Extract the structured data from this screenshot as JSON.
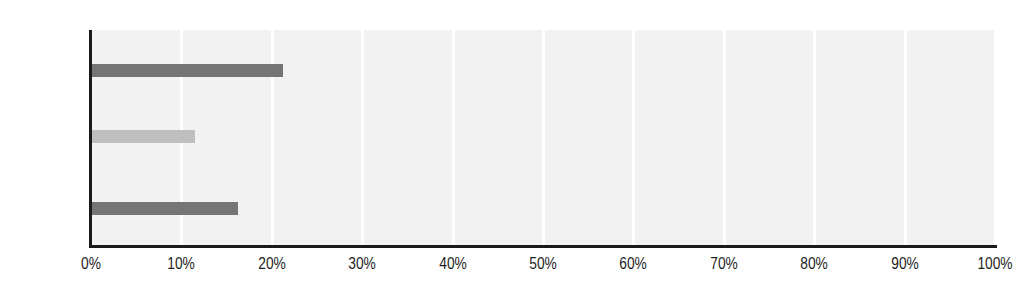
{
  "chart_data": {
    "type": "bar",
    "orientation": "horizontal",
    "title": "",
    "xlabel": "",
    "ylabel": "",
    "categories": [
      "Men",
      "Women",
      "All"
    ],
    "values": [
      21.2,
      11.5,
      16.3
    ],
    "bar_colors": [
      "#757575",
      "#bfbfbf",
      "#757575"
    ],
    "xlim": [
      0,
      100
    ],
    "xticks": [
      0,
      10,
      20,
      30,
      40,
      50,
      60,
      70,
      80,
      90,
      100
    ],
    "xtick_labels": [
      "0%",
      "10%",
      "20%",
      "30%",
      "40%",
      "50%",
      "60%",
      "70%",
      "80%",
      "90%",
      "100%"
    ],
    "grid": "vertical",
    "gridline_color": "#ffffff",
    "plot_background": "#f2f2f2",
    "axis_color": "#1a1a1a",
    "legend": "none",
    "series": [
      {
        "name": "Share",
        "points": [
          {
            "category": "Men",
            "value": 21.2,
            "label": "21%",
            "color": "#757575"
          },
          {
            "category": "Women",
            "value": 11.5,
            "label": "11.5%",
            "color": "#bfbfbf"
          },
          {
            "category": "All",
            "value": 16.3,
            "label": "16%",
            "color": "#757575"
          }
        ]
      }
    ]
  },
  "figure": {
    "background": "#ffffff",
    "clipped_title": "  "
  }
}
